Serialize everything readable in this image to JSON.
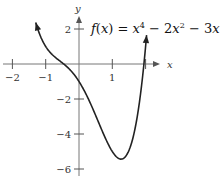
{
  "chart_data": {
    "type": "line",
    "title_parts": {
      "lhs": "f(x) = ",
      "t1": "x",
      "e1": "4",
      "t2": " − 2",
      "t2x": "x",
      "e2": "2",
      "t3": " − 3",
      "t3x": "x",
      "t4": " − 1"
    },
    "xlabel": "x",
    "ylabel": "y",
    "xlim": [
      -2.2,
      2.9
    ],
    "ylim": [
      -6.3,
      3.0
    ],
    "x_ticks": [
      -2,
      -1,
      1
    ],
    "x_tick_labels": [
      "−2",
      "−1",
      "1"
    ],
    "y_ticks": [
      2,
      -2,
      -4,
      -6
    ],
    "y_tick_labels": [
      "2",
      "−2",
      "−4",
      "−6"
    ],
    "grid": false,
    "legend": null,
    "series": [
      {
        "name": "f(x)",
        "function": "x^4 - 2x^2 - 3x - 1",
        "x_range": [
          -1.3,
          2.03
        ],
        "arrows": "both ends",
        "x": [
          -1.3,
          -1.0,
          -0.5,
          0.0,
          0.5,
          1.0,
          1.24,
          1.5,
          2.0
        ],
        "y": [
          2.38,
          1.0,
          -0.94,
          -1.0,
          -2.94,
          -5.0,
          -5.43,
          -4.94,
          1.0
        ]
      }
    ],
    "color": "#222222"
  }
}
